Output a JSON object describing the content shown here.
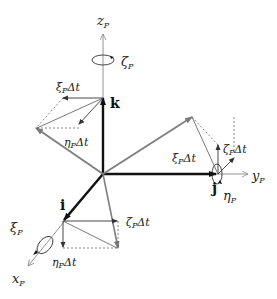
{
  "figure": {
    "axes": {
      "z": {
        "label": "z",
        "subscript": "P",
        "rotation_label": "ζ",
        "rotation_sub": "P"
      },
      "y": {
        "label": "y",
        "subscript": "P",
        "rotation_label": "η",
        "rotation_sub": "P"
      },
      "x": {
        "label": "x",
        "subscript": "P",
        "rotation_label": "ξ",
        "rotation_sub": "P"
      }
    },
    "unit_vectors": {
      "k": "k",
      "j": "j",
      "i": "i"
    },
    "increments": {
      "k_xi": {
        "sym": "ξ",
        "sub": "P",
        "tail": "Δt"
      },
      "k_eta": {
        "sym": "η",
        "sub": "P",
        "tail": "Δt"
      },
      "j_xi": {
        "sym": "ξ",
        "sub": "P",
        "tail": "Δt"
      },
      "j_zeta": {
        "sym": "ζ",
        "sub": "P",
        "tail": "Δt"
      },
      "i_zeta": {
        "sym": "ζ",
        "sub": "P",
        "tail": "Δt"
      },
      "i_eta": {
        "sym": "η",
        "sub": "P",
        "tail": "Δt"
      }
    },
    "colors": {
      "unit_vector": "#111111",
      "rotated_vector": "#808080",
      "axis": "#888888",
      "component": "#444444"
    }
  }
}
